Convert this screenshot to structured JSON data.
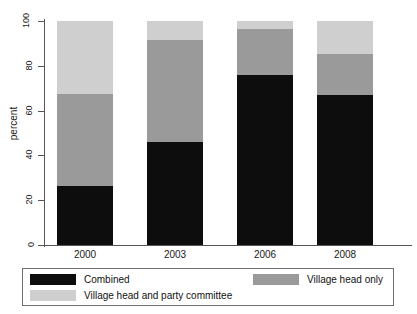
{
  "chart_data": {
    "type": "bar",
    "title": "",
    "xlabel": "",
    "ylabel": "percent",
    "ylim": [
      0,
      100
    ],
    "yticks": [
      0,
      20,
      40,
      60,
      80,
      100
    ],
    "grid": false,
    "stacked": true,
    "legend_position": "bottom",
    "categories": [
      "2000",
      "2003",
      "2006",
      "2008"
    ],
    "series": [
      {
        "name": "Combined",
        "color": "#0d0d0d",
        "values": [
          26.3,
          46.0,
          76.1,
          67.0
        ]
      },
      {
        "name": "Village head only",
        "color": "#9a9a9a",
        "values": [
          40.9,
          45.7,
          20.3,
          18.3
        ]
      },
      {
        "name": "Village head and party committee",
        "color": "#cfcfcf",
        "values": [
          32.8,
          8.3,
          3.6,
          14.7
        ]
      }
    ]
  },
  "axis": {
    "y_label": "percent",
    "y_ticks": [
      "0",
      "20",
      "40",
      "60",
      "80",
      "100"
    ],
    "x_ticks": [
      "2000",
      "2003",
      "2006",
      "2008"
    ]
  },
  "legend": {
    "items": [
      {
        "label": "Combined",
        "color": "#0d0d0d"
      },
      {
        "label": "Village head only",
        "color": "#9a9a9a"
      },
      {
        "label": "Village head and party committee",
        "color": "#cfcfcf"
      }
    ]
  }
}
